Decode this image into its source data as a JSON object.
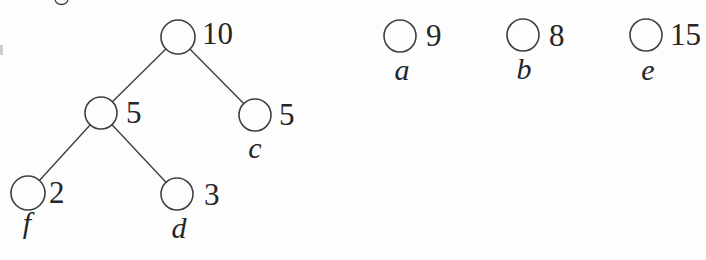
{
  "figure": {
    "description_colors": {
      "stroke": "#3f3f3f",
      "text": "#262626",
      "background": "#fdfdfd"
    },
    "tree_nodes": [
      {
        "id": "root",
        "value": "10"
      },
      {
        "id": "internal",
        "value": "5"
      },
      {
        "id": "c",
        "value": "5",
        "letter": "c"
      },
      {
        "id": "f",
        "value": "2",
        "letter": "f"
      },
      {
        "id": "d",
        "value": "3",
        "letter": "d"
      }
    ],
    "edges": [
      [
        "root",
        "internal"
      ],
      [
        "root",
        "c"
      ],
      [
        "internal",
        "f"
      ],
      [
        "internal",
        "d"
      ]
    ],
    "single_nodes": [
      {
        "id": "a",
        "value": "9",
        "letter": "a"
      },
      {
        "id": "b",
        "value": "8",
        "letter": "b"
      },
      {
        "id": "e",
        "value": "15",
        "letter": "e"
      }
    ]
  },
  "colors": {
    "stroke": "#3f3f3f",
    "text": "#262626",
    "background": "#fdfdfd"
  }
}
